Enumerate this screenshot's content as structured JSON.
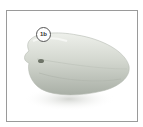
{
  "image": {
    "subject": "bell pepper",
    "description": "Pale green bell pepper lying on its side, with a callout circle near the stem",
    "colors": {
      "pepper_light": "#e6e9e2",
      "pepper_mid": "#c9cec6",
      "pepper_dark": "#9fa59c",
      "frame_border": "#9a9a9a",
      "shadow": "#d8dad6"
    }
  },
  "callout": {
    "label": "1b"
  }
}
